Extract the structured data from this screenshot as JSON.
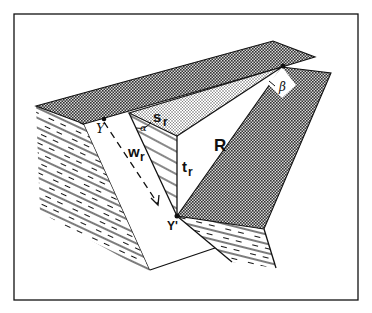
{
  "diagram": {
    "type": "block-diagram",
    "labels": {
      "Y": "Y",
      "Y_prime": "Y'",
      "s_r_main": "s",
      "s_r_sub": "r",
      "w_r_main": "w",
      "w_r_sub": "r",
      "t_r_main": "t",
      "t_r_sub": "r",
      "R": "R",
      "alpha": "α",
      "beta": "β"
    },
    "colors": {
      "line": "#111111",
      "background": "#ffffff",
      "dark_stipple": "#8a8a8a",
      "light_stipple": "#c8c8c8"
    }
  }
}
